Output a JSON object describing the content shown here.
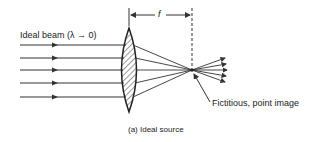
{
  "diagram": {
    "beam_label": "Ideal beam (λ → 0)",
    "focal_label": "f",
    "image_label": "Fictitious, point image",
    "caption": "(a)  Ideal source",
    "colors": {
      "line": "#333333",
      "background": "#ffffff"
    },
    "elements": {
      "incoming_rays": 5,
      "lens": "biconvex, hatched",
      "outgoing_rays": 5
    }
  }
}
